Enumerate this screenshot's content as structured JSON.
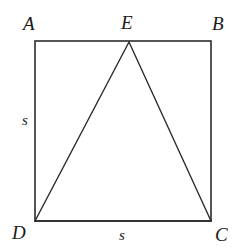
{
  "figure": {
    "background_color": "#ffffff",
    "stroke_color": "#2b2b2b",
    "square": {
      "name": "ABCD",
      "x": 35,
      "y": 41,
      "width": 176,
      "height": 180,
      "stroke_width": 1.6
    },
    "triangle": {
      "name": "DEC",
      "points": "129,42 35,221 211,221",
      "stroke_width": 1.4
    },
    "vertices": [
      {
        "id": "A",
        "label": "A",
        "x": 35,
        "y": 41,
        "position": "top-left"
      },
      {
        "id": "E",
        "label": "E",
        "x": 129,
        "y": 42,
        "position": "top-middle"
      },
      {
        "id": "B",
        "label": "B",
        "x": 211,
        "y": 41,
        "position": "top-right"
      },
      {
        "id": "D",
        "label": "D",
        "x": 35,
        "y": 221,
        "position": "bottom-left"
      },
      {
        "id": "C",
        "label": "C",
        "x": 211,
        "y": 221,
        "position": "bottom-right"
      }
    ],
    "side_labels": [
      {
        "id": "s-left",
        "label": "s",
        "side": "AD",
        "placement": "left"
      },
      {
        "id": "s-bottom",
        "label": "s",
        "side": "DC",
        "placement": "bottom"
      }
    ]
  }
}
